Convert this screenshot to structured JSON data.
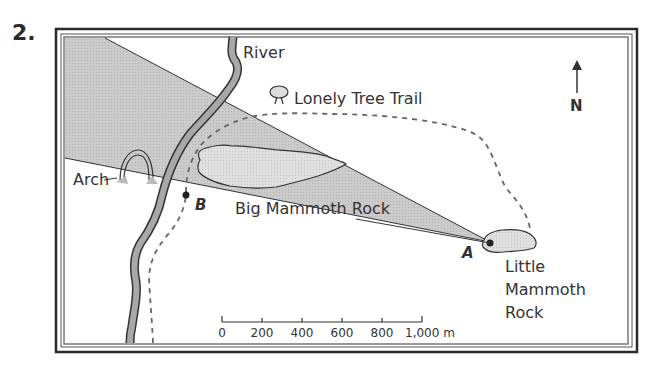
{
  "question_number": "2.",
  "labels": {
    "river": "River",
    "trail": "Lonely Tree Trail",
    "arch": "Arch",
    "big_rock": "Big Mammoth Rock",
    "little_rock_line1": "Little",
    "little_rock_line2": "Mammoth",
    "little_rock_line3": "Rock",
    "point_a": "A",
    "point_b": "B",
    "north": "N"
  },
  "scale_bar": {
    "ticks": [
      "0",
      "200",
      "400",
      "600",
      "800",
      "1,000 m"
    ]
  },
  "colors": {
    "frame": "#2b2b2b",
    "shade": "#c8c8c8",
    "river_fill": "#a8a8a8",
    "rock_fill": "#dcdcdc",
    "line": "#333333",
    "trail_dash": "#666666"
  }
}
